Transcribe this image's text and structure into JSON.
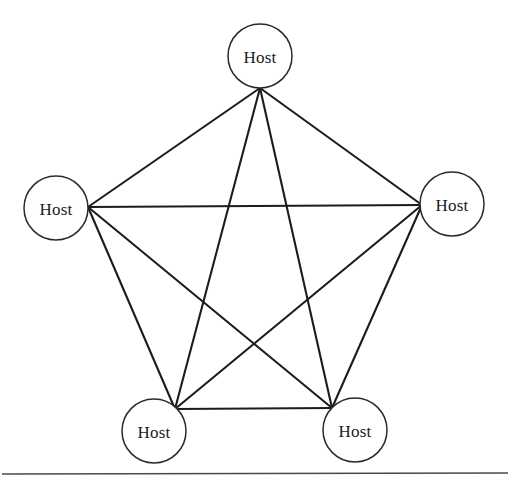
{
  "figure": {
    "background_color": "#ffffff",
    "edge_color": "#1c1c1c",
    "node_fill_color": "#ffffff",
    "node_stroke_color": "#2a2a2a",
    "text_color": "#1b1b1b"
  },
  "diagram_data": {
    "type": "graph",
    "topology": "full-mesh",
    "node_count": 5,
    "edge_count": 10,
    "node_radius": 32,
    "nodes": [
      {
        "id": "top",
        "label": "Host",
        "cx": 260,
        "cy": 56,
        "ax": 260,
        "ay": 88
      },
      {
        "id": "left",
        "label": "Host",
        "cx": 56,
        "cy": 208,
        "ax": 88,
        "ay": 207
      },
      {
        "id": "right",
        "label": "Host",
        "cx": 452,
        "cy": 204,
        "ax": 422,
        "ay": 205
      },
      {
        "id": "bottom-left",
        "label": "Host",
        "cx": 154,
        "cy": 431,
        "ax": 175,
        "ay": 409
      },
      {
        "id": "bottom-right",
        "label": "Host",
        "cx": 355,
        "cy": 430,
        "ax": 332,
        "ay": 408
      }
    ],
    "edges": [
      {
        "from": "top",
        "to": "left"
      },
      {
        "from": "top",
        "to": "right"
      },
      {
        "from": "top",
        "to": "bottom-left"
      },
      {
        "from": "top",
        "to": "bottom-right"
      },
      {
        "from": "left",
        "to": "right"
      },
      {
        "from": "left",
        "to": "bottom-left"
      },
      {
        "from": "left",
        "to": "bottom-right"
      },
      {
        "from": "right",
        "to": "bottom-left"
      },
      {
        "from": "right",
        "to": "bottom-right"
      },
      {
        "from": "bottom-left",
        "to": "bottom-right"
      }
    ]
  },
  "footer": {
    "rule": {
      "x1": 2,
      "y1": 474,
      "x2": 508,
      "y2": 473
    }
  }
}
